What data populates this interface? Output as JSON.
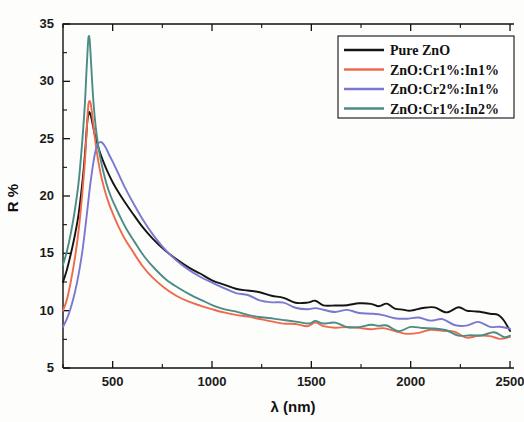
{
  "chart_data": {
    "type": "line",
    "title": "",
    "xlabel": "λ (nm)",
    "ylabel": "R %",
    "xlim": [
      250,
      2520
    ],
    "ylim": [
      5,
      35
    ],
    "xticks": [
      500,
      1000,
      1500,
      2000,
      2500
    ],
    "xtick_labels": [
      "500",
      "1000",
      "1500",
      "2000",
      "2500"
    ],
    "yticks": [
      5,
      10,
      15,
      20,
      25,
      30,
      35
    ],
    "ytick_labels": [
      "5",
      "10",
      "15",
      "20",
      "25",
      "30",
      "35"
    ],
    "x_minor_step": 250,
    "y_minor_step": 2.5,
    "grid": false,
    "legend_position": "top-right",
    "series": [
      {
        "name": "Pure ZnO",
        "color": "#141414",
        "x": [
          250,
          270,
          290,
          310,
          330,
          350,
          362,
          372,
          380,
          390,
          400,
          412,
          425,
          440,
          460,
          480,
          500,
          530,
          560,
          600,
          650,
          700,
          760,
          820,
          880,
          940,
          1000,
          1060,
          1120,
          1180,
          1240,
          1300,
          1360,
          1420,
          1480,
          1520,
          1560,
          1620,
          1680,
          1740,
          1800,
          1840,
          1880,
          1920,
          1960,
          2000,
          2060,
          2120,
          2180,
          2240,
          2280,
          2320,
          2360,
          2400,
          2440,
          2470,
          2500
        ],
        "y": [
          12.5,
          13.6,
          15.0,
          16.6,
          18.6,
          21.6,
          24.0,
          26.4,
          27.3,
          27.0,
          26.2,
          25.2,
          24.4,
          23.6,
          22.7,
          21.9,
          21.2,
          20.3,
          19.5,
          18.5,
          17.3,
          16.3,
          15.3,
          14.5,
          13.8,
          13.2,
          12.7,
          12.3,
          12.0,
          11.7,
          11.5,
          11.2,
          11.0,
          10.8,
          10.7,
          10.8,
          10.6,
          10.5,
          10.6,
          10.5,
          10.7,
          10.4,
          10.5,
          10.3,
          10.2,
          10.2,
          10.2,
          10.1,
          10.0,
          10.1,
          9.8,
          9.9,
          9.7,
          9.8,
          9.5,
          9.2,
          8.4
        ]
      },
      {
        "name": "ZnO:Cr1%:In1%",
        "color": "#ef6a4c",
        "x": [
          250,
          270,
          290,
          310,
          330,
          350,
          362,
          372,
          378,
          384,
          390,
          396,
          404,
          414,
          426,
          440,
          460,
          480,
          500,
          530,
          560,
          600,
          650,
          700,
          760,
          820,
          880,
          940,
          1000,
          1060,
          1120,
          1180,
          1240,
          1300,
          1360,
          1420,
          1480,
          1520,
          1560,
          1620,
          1680,
          1740,
          1800,
          1860,
          1920,
          1980,
          2040,
          2100,
          2160,
          2220,
          2280,
          2340,
          2400,
          2450,
          2500
        ],
        "y": [
          10.0,
          11.0,
          12.6,
          14.6,
          17.2,
          20.8,
          23.5,
          26.6,
          28.0,
          28.3,
          28.0,
          27.2,
          26.0,
          24.6,
          23.2,
          21.9,
          20.5,
          19.4,
          18.5,
          17.3,
          16.3,
          15.2,
          13.9,
          12.9,
          12.0,
          11.3,
          10.8,
          10.4,
          10.1,
          9.8,
          9.6,
          9.4,
          9.2,
          9.1,
          8.9,
          8.8,
          8.7,
          8.8,
          8.6,
          8.5,
          8.5,
          8.4,
          8.4,
          8.3,
          8.2,
          8.2,
          8.1,
          8.1,
          8.0,
          7.9,
          7.8,
          7.7,
          7.6,
          7.5,
          7.5
        ]
      },
      {
        "name": "ZnO:Cr2%:In1%",
        "color": "#7b78cf",
        "x": [
          250,
          270,
          290,
          310,
          330,
          350,
          370,
          385,
          400,
          412,
          424,
          436,
          450,
          466,
          482,
          500,
          530,
          560,
          600,
          650,
          700,
          760,
          820,
          880,
          940,
          1000,
          1060,
          1120,
          1180,
          1240,
          1300,
          1360,
          1420,
          1480,
          1520,
          1560,
          1620,
          1680,
          1740,
          1800,
          1860,
          1920,
          1980,
          2040,
          2100,
          2160,
          2220,
          2280,
          2340,
          2400,
          2450,
          2500
        ],
        "y": [
          8.6,
          9.3,
          10.3,
          11.6,
          13.3,
          15.5,
          18.4,
          20.7,
          22.6,
          23.8,
          24.5,
          24.7,
          24.6,
          24.2,
          23.6,
          23.0,
          21.9,
          20.8,
          19.5,
          18.0,
          16.7,
          15.4,
          14.4,
          13.6,
          12.9,
          12.4,
          12.0,
          11.6,
          11.3,
          11.0,
          10.8,
          10.6,
          10.4,
          10.2,
          10.2,
          10.1,
          10.0,
          9.9,
          9.8,
          9.7,
          9.6,
          9.5,
          9.4,
          9.3,
          9.2,
          9.1,
          9.0,
          8.9,
          8.8,
          8.7,
          8.6,
          8.5
        ]
      },
      {
        "name": "ZnO:Cr1%:In2%",
        "color": "#4b8c86",
        "x": [
          250,
          270,
          290,
          310,
          330,
          348,
          360,
          368,
          374,
          378,
          382,
          386,
          392,
          400,
          410,
          422,
          436,
          452,
          470,
          490,
          510,
          540,
          570,
          610,
          660,
          710,
          770,
          830,
          890,
          950,
          1010,
          1070,
          1130,
          1190,
          1250,
          1310,
          1370,
          1430,
          1490,
          1520,
          1560,
          1620,
          1680,
          1740,
          1800,
          1840,
          1880,
          1940,
          2000,
          2060,
          2120,
          2180,
          2240,
          2300,
          2360,
          2420,
          2470,
          2500
        ],
        "y": [
          14.0,
          15.2,
          16.8,
          18.8,
          21.4,
          25.0,
          28.0,
          30.8,
          32.8,
          33.8,
          33.9,
          33.2,
          31.4,
          29.0,
          26.8,
          25.0,
          23.5,
          22.2,
          21.0,
          20.0,
          19.2,
          18.1,
          17.1,
          16.0,
          14.7,
          13.7,
          12.7,
          12.0,
          11.4,
          10.9,
          10.5,
          10.1,
          9.8,
          9.6,
          9.4,
          9.2,
          9.1,
          9.0,
          8.9,
          9.2,
          8.9,
          8.8,
          8.7,
          8.6,
          8.6,
          8.5,
          8.5,
          8.4,
          8.4,
          8.3,
          8.3,
          8.2,
          8.1,
          8.1,
          8.0,
          7.9,
          7.8,
          7.6
        ]
      }
    ]
  },
  "axes": {
    "y_title": "R %",
    "x_title": "λ (nm)"
  },
  "legend": {
    "entries": [
      {
        "label": "Pure ZnO",
        "color": "#141414"
      },
      {
        "label": "ZnO:Cr1%:In1%",
        "color": "#ef6a4c"
      },
      {
        "label": "ZnO:Cr2%:In1%",
        "color": "#7b78cf"
      },
      {
        "label": "ZnO:Cr1%:In2%",
        "color": "#4b8c86"
      }
    ]
  }
}
